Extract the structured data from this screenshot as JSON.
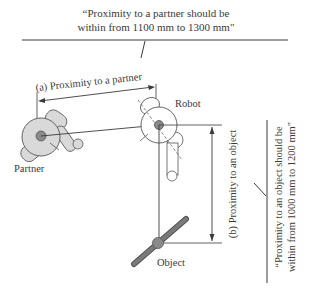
{
  "diagram": {
    "callout_partner": {
      "line1": "“Proximity to a partner should be",
      "line2": "within from 1100 mm to 1300 mm\""
    },
    "callout_object": {
      "line1": "“Proximity to an object should be",
      "line2": "within from 1000 mm to 1200 mm\""
    },
    "dimension_a_label": "(a) Proximity to a partner",
    "dimension_b_label": "(b) Proximity to an object",
    "partner_label": "Partner",
    "robot_label": "Robot",
    "object_label": "Object",
    "colors": {
      "line": "#3a3a3a",
      "body_fill": "#d9d9d9",
      "center_fill": "#8a8a8a",
      "object_rod": "#7a7a7a"
    }
  }
}
